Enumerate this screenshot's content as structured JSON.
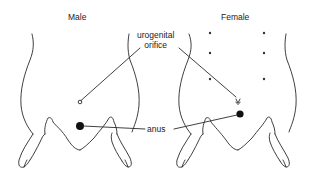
{
  "figure": {
    "type": "anatomical line drawing",
    "panels": [
      {
        "id": "male",
        "title": "Male"
      },
      {
        "id": "female",
        "title": "Female"
      }
    ],
    "labels": {
      "urogenital_line1": "urogenital",
      "urogenital_line2": "orifice",
      "anus": "anus"
    },
    "female_nipples": 6,
    "colors": {
      "stroke": "#2a2a2a",
      "background": "#ffffff",
      "text": "#222222"
    }
  }
}
